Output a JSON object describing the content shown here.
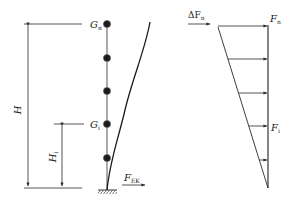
{
  "diagram": {
    "colors": {
      "line": "#2a2a2a",
      "mass": "#1c1c1c",
      "thin": "#555555"
    },
    "left_model": {
      "top_mass_label": {
        "main": "G",
        "sub": "n"
      },
      "mid_mass_label": {
        "main": "G",
        "sub": "i"
      },
      "total_height_label": {
        "main": "H",
        "sub": ""
      },
      "level_height_label": {
        "main": "H",
        "sub": "i"
      },
      "base_shear_label": {
        "main": "F",
        "sub": "EK"
      },
      "mass_count": 5
    },
    "right_distribution": {
      "top_extra_force_label": {
        "main": "ΔF",
        "sub": "n"
      },
      "top_force_label": {
        "main": "F",
        "sub": "n"
      },
      "level_force_label": {
        "main": "F",
        "sub": "i"
      },
      "arrow_count": 5,
      "shape": "inverted triangle"
    }
  }
}
